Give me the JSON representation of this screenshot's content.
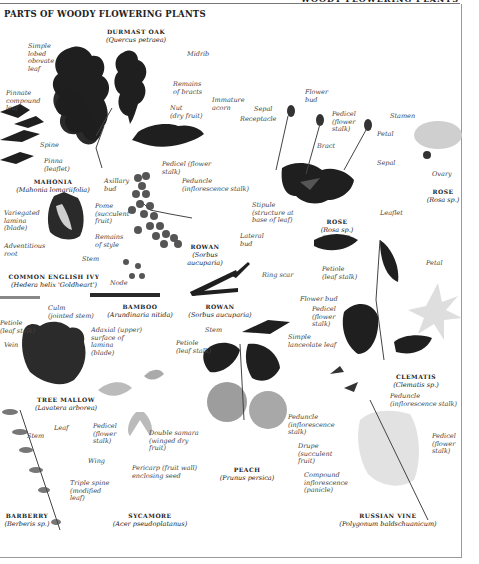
{
  "page": {
    "title": "PARTS OF WOODY FLOWERING PLANTS",
    "running_head": "WOODY FLOWERING PLANTS"
  },
  "specimens": [
    {
      "id": "oak",
      "name": "DURMAST OAK",
      "latin": "(Quercus petraea)"
    },
    {
      "id": "mahonia",
      "name": "MAHONIA",
      "latin": "(Mahonia lomariifolia)"
    },
    {
      "id": "ivy",
      "name": "COMMON ENGLISH IVY",
      "latin": "(Hedera helix 'Goldheart')"
    },
    {
      "id": "bamboo",
      "name": "BAMBOO",
      "latin": "(Arundinaria nitida)"
    },
    {
      "id": "rowan1",
      "name": "ROWAN",
      "latin": "(Sorbus aucuparia)"
    },
    {
      "id": "rowan2",
      "name": "ROWAN",
      "latin": "(Sorbus aucuparia)"
    },
    {
      "id": "rose1",
      "name": "ROSE",
      "latin": "(Rosa sp.)"
    },
    {
      "id": "rose2",
      "name": "ROSE",
      "latin": "(Rosa sp.)"
    },
    {
      "id": "clematis",
      "name": "CLEMATIS",
      "latin": "(Clematis sp.)"
    },
    {
      "id": "mallow",
      "name": "TREE MALLOW",
      "latin": "(Lavatera arborea)"
    },
    {
      "id": "peach",
      "name": "PEACH",
      "latin": "(Prunus persica)"
    },
    {
      "id": "sycamore",
      "name": "SYCAMORE",
      "latin": "(Acer pseudoplatanus)"
    },
    {
      "id": "barberry",
      "name": "BARBERRY",
      "latin": "(Berberis sp.)"
    },
    {
      "id": "russianvine",
      "name": "RUSSIAN VINE",
      "latin": "(Polygonum baldschuanicum)"
    }
  ],
  "labels": {
    "simple_lobed": "Simple\nlobed\nobovate\nleaf",
    "midrib": "Midrib",
    "remains_bracts": "Remains\nof bracts",
    "nut": "Nut\n(dry fruit)",
    "immature_acorn": "Immature\nacorn",
    "pinnate": "Pinnate\ncompound\nleaf",
    "spine": "Spine",
    "pinna": "Pinna\n(leaflet)",
    "axillary_bud": "Axillary\nbud",
    "pedicel_rowan": "Pedicel (flower\nstalk)",
    "peduncle_rowan": "Peduncle\n(inflorescence stalk)",
    "pome": "Pome\n(succulent\nfruit)",
    "remains_style": "Remains\nof style",
    "variegated": "Variegated\nlamina\n(blade)",
    "adventitious": "Adventitious\nroot",
    "stem_ivy": "Stem",
    "node": "Node",
    "culm": "Culm\n(jointed stem)",
    "lateral_bud": "Lateral\nbud",
    "ring_scar": "Ring scar",
    "sepal_rose": "Sepal",
    "receptacle": "Receptacle",
    "flower_bud_rose": "Flower\nbud",
    "pedicel_rose": "Pedicel\n(flower\nstalk)",
    "bract": "Bract",
    "stipule": "Stipule\n(structure at\nbase of leaf)",
    "leaflet": "Leaflet",
    "stamen": "Stamen",
    "petal_rose": "Petal",
    "sepal_rose2": "Sepal",
    "ovary": "Ovary",
    "petiole_clematis": "Petiole\n(leaf stalk)",
    "petal_clematis": "Petal",
    "flower_bud_clematis": "Flower bud",
    "pedicel_clematis": "Pedicel\n(flower\nstalk)",
    "petiole_mallow": "Petiole\n(leaf stalk)",
    "vein": "Vein",
    "adaxial": "Adaxial (upper)\nsurface of\nlamina\n(blade)",
    "stem_peach": "Stem",
    "petiole_peach": "Petiole\n(leaf stalk)",
    "simple_lanceolate": "Simple\nlanceolate leaf",
    "peduncle_peach": "Peduncle\n(inflorescence\nstalk)",
    "drupe": "Drupe\n(succulent\nfruit)",
    "peduncle_vine": "Peduncle\n(inflorescence stalk)",
    "pedicel_vine": "Pedicel\n(flower\nstalk)",
    "compound_inflor": "Compound\ninflorescence\n(panicle)",
    "stem_barberry": "Stem",
    "leaf_barberry": "Leaf",
    "triple_spine": "Triple spine\n(modified\nleaf)",
    "pedicel_sycamore": "Pedicel\n(flower\nstalk)",
    "wing": "Wing",
    "double_samara": "Double samara\n(winged dry\nfruit)",
    "pericarp": "Pericarp (fruit wall)\nenclosing seed"
  },
  "colors": {
    "leaf_dark": "#1f1f1f",
    "leaf_mid": "#3a3a3a",
    "fruit": "#5a5a5a",
    "peach": "#9a9a9a",
    "pale": "#d8d8d8"
  }
}
